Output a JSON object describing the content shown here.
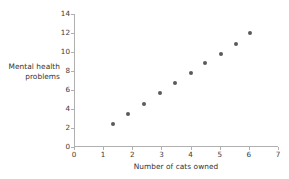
{
  "chart_data": {
    "type": "scatter",
    "title": "",
    "xlabel": "Number of cats owned",
    "ylabel": "Mental health problems",
    "ylabel_lines": [
      "Mental health",
      "problems"
    ],
    "xlim": [
      0,
      7
    ],
    "ylim": [
      0,
      14
    ],
    "xticks": [
      0,
      1,
      2,
      3,
      4,
      5,
      6,
      7
    ],
    "yticks": [
      0,
      2,
      4,
      6,
      8,
      10,
      12,
      14
    ],
    "xticklabels": [
      "0",
      "1",
      "2",
      "3",
      "4",
      "5",
      "6",
      "7"
    ],
    "yticklabels": [
      "0",
      "2",
      "4",
      "6",
      "8",
      "10",
      "12",
      "14"
    ],
    "grid": false,
    "legend": false,
    "marker": "circle",
    "marker_color": "#5a5a5a",
    "marker_size": 4,
    "n_points": 11,
    "x": [
      1.35,
      1.85,
      2.4,
      2.95,
      3.45,
      4.0,
      4.5,
      5.05,
      5.55,
      6.05,
      3.95
    ],
    "y": [
      2.45,
      3.5,
      4.55,
      5.65,
      6.7,
      7.8,
      8.8,
      9.8,
      10.85,
      12.0,
      7.8
    ],
    "points": [
      {
        "x": 1.35,
        "y": 2.45
      },
      {
        "x": 1.85,
        "y": 3.5
      },
      {
        "x": 2.4,
        "y": 4.55
      },
      {
        "x": 2.95,
        "y": 5.65
      },
      {
        "x": 3.45,
        "y": 6.7
      },
      {
        "x": 4.0,
        "y": 7.8
      },
      {
        "x": 4.5,
        "y": 8.8
      },
      {
        "x": 5.05,
        "y": 9.8
      },
      {
        "x": 5.55,
        "y": 10.85
      },
      {
        "x": 6.05,
        "y": 12.0
      }
    ]
  },
  "colors": {
    "background": "#ffffff",
    "axis": "#b0b0b0",
    "text": "#3a3a3a",
    "marker": "#5a5a5a"
  }
}
